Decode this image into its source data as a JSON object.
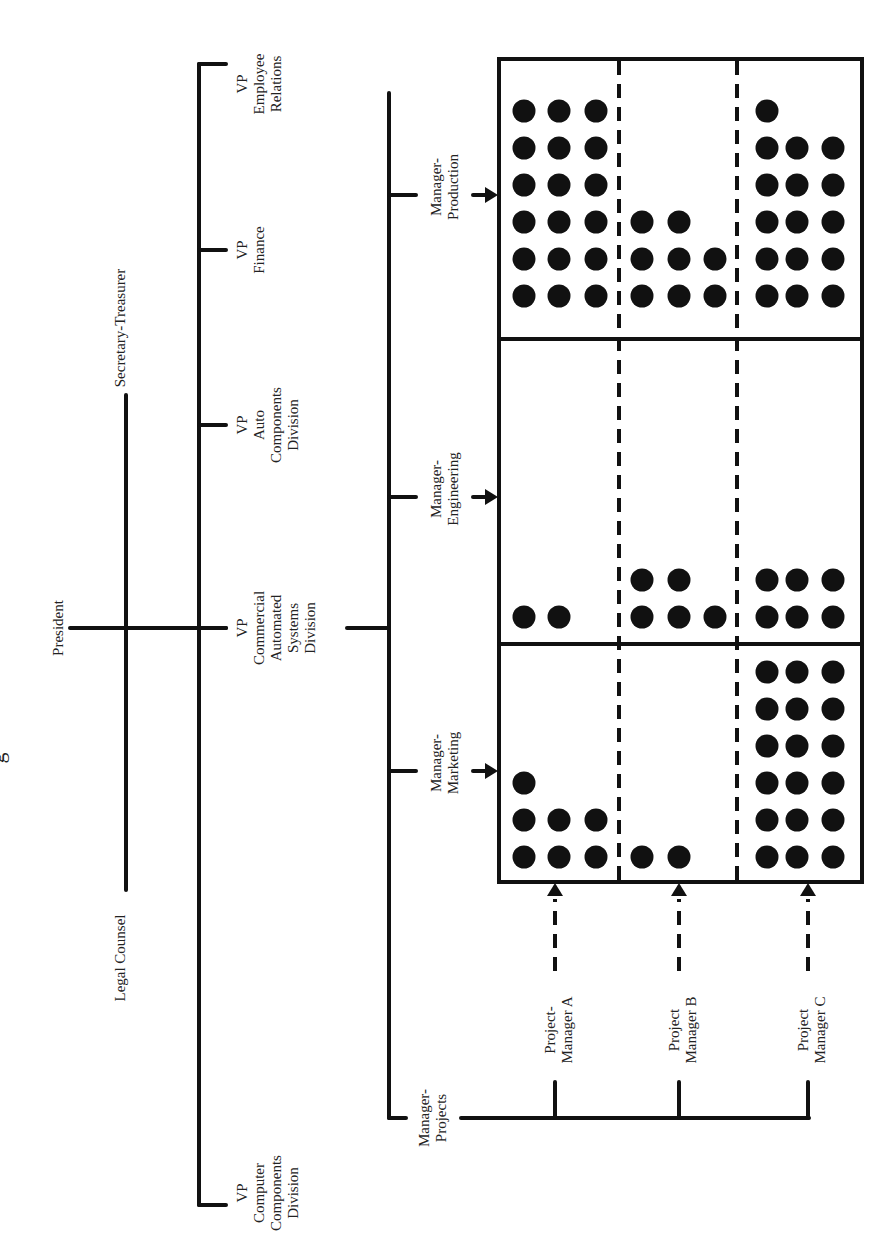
{
  "colors": {
    "ink": "#111111",
    "paper": "#ffffff",
    "text": "#222222"
  },
  "title_fragment": "g",
  "executive": {
    "president": "President",
    "secretary_treasurer": "Secretary-Treasurer",
    "legal_counsel": "Legal Counsel"
  },
  "vice_presidents": [
    {
      "id": "employee-relations",
      "lines": [
        "VP",
        "Employee",
        "Relations"
      ],
      "y": 64
    },
    {
      "id": "finance",
      "lines": [
        "VP",
        "Finance"
      ],
      "y": 250
    },
    {
      "id": "auto-components",
      "lines": [
        "VP",
        "Auto",
        "Components",
        "Division"
      ],
      "y": 425
    },
    {
      "id": "commercial-automated-systems",
      "lines": [
        "VP",
        "Commercial",
        "Automated",
        "Systems",
        "Division"
      ],
      "y": 628
    },
    {
      "id": "computer-components",
      "lines": [
        "VP",
        "Computer",
        "Components",
        "Division"
      ],
      "y": 1205
    }
  ],
  "functional_managers": [
    {
      "id": "production",
      "lines": [
        "Manager-",
        "Production"
      ],
      "y": 195
    },
    {
      "id": "engineering",
      "lines": [
        "Manager-",
        "Engineering"
      ],
      "y": 497
    },
    {
      "id": "marketing",
      "lines": [
        "Manager-",
        "Marketing"
      ],
      "y": 771
    }
  ],
  "manager_projects": {
    "lines": [
      "Manager-",
      "Projects"
    ]
  },
  "project_managers": [
    {
      "id": "a",
      "lines": [
        "Project-",
        "Manager A"
      ],
      "x": 555
    },
    {
      "id": "b",
      "lines": [
        "Project",
        "Manager B"
      ],
      "x": 679
    },
    {
      "id": "c",
      "lines": [
        "Project",
        "Manager C"
      ],
      "x": 808
    }
  ],
  "chart_data": {
    "type": "matrix",
    "rows": [
      "Manager-Production",
      "Manager-Engineering",
      "Manager-Marketing"
    ],
    "columns": [
      "Project-Manager A",
      "Project Manager B",
      "Project Manager C"
    ],
    "personnel_dots": [
      [
        18,
        8,
        16
      ],
      [
        2,
        5,
        6
      ],
      [
        7,
        2,
        18
      ]
    ],
    "dot_rows_per_cell": [
      [
        [
          3,
          3,
          3,
          3,
          3,
          3
        ],
        [
          2,
          3,
          3
        ],
        [
          1,
          3,
          3,
          3,
          3,
          3
        ]
      ],
      [
        [
          2
        ],
        [
          2,
          3
        ],
        [
          3,
          3
        ]
      ],
      [
        [
          1,
          3,
          3
        ],
        [
          2
        ],
        [
          3,
          3,
          3,
          3,
          3,
          3
        ]
      ]
    ]
  }
}
